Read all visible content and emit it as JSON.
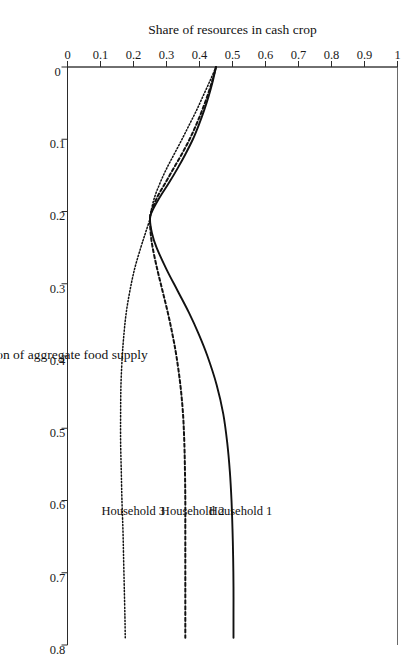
{
  "chart_data": {
    "type": "line",
    "title": "",
    "xlabel": "Coefficient of variation of aggregate food supply",
    "ylabel": "Share of resources in cash crop",
    "xlim": [
      0,
      0.8
    ],
    "ylim": [
      0,
      1
    ],
    "xticks": [
      "0",
      "0.1",
      "0.2",
      "0.3",
      "0.4",
      "0.5",
      "0.6",
      "0.7",
      "0.8"
    ],
    "xtick_values": [
      0,
      0.1,
      0.2,
      0.3,
      0.4,
      0.5,
      0.6,
      0.7,
      0.8
    ],
    "yticks": [
      "0",
      "0.1",
      "0.2",
      "0.3",
      "0.4",
      "0.5",
      "0.6",
      "0.7",
      "0.8",
      "0.9",
      "1"
    ],
    "ytick_values": [
      0,
      0.1,
      0.2,
      0.3,
      0.4,
      0.5,
      0.6,
      0.7,
      0.8,
      0.9,
      1
    ],
    "grid": false,
    "legend": "inline-labels",
    "orientation": "rotated-90-clockwise",
    "series": [
      {
        "name": "Household 1",
        "style": "solid",
        "color": "#111111",
        "label_x": 0.62,
        "label_y": 0.5,
        "x": [
          0.0,
          0.02,
          0.04,
          0.06,
          0.08,
          0.1,
          0.12,
          0.14,
          0.16,
          0.18,
          0.2,
          0.21,
          0.23,
          0.25,
          0.28,
          0.31,
          0.34,
          0.37,
          0.4,
          0.44,
          0.48,
          0.52,
          0.56,
          0.6,
          0.64,
          0.68,
          0.72,
          0.76,
          0.79
        ],
        "y": [
          0.45,
          0.44,
          0.428,
          0.414,
          0.398,
          0.38,
          0.358,
          0.334,
          0.308,
          0.28,
          0.256,
          0.25,
          0.256,
          0.27,
          0.3,
          0.334,
          0.368,
          0.398,
          0.424,
          0.452,
          0.472,
          0.484,
          0.492,
          0.497,
          0.5,
          0.502,
          0.503,
          0.503,
          0.503
        ]
      },
      {
        "name": "Household 2",
        "style": "dashed",
        "color": "#111111",
        "label_x": 0.62,
        "label_y": 0.355,
        "x": [
          0.0,
          0.02,
          0.04,
          0.06,
          0.08,
          0.1,
          0.12,
          0.14,
          0.16,
          0.18,
          0.2,
          0.21,
          0.23,
          0.25,
          0.28,
          0.31,
          0.34,
          0.37,
          0.4,
          0.44,
          0.48,
          0.52,
          0.56,
          0.6,
          0.64,
          0.68,
          0.72,
          0.76,
          0.79
        ],
        "y": [
          0.45,
          0.438,
          0.424,
          0.408,
          0.39,
          0.37,
          0.347,
          0.322,
          0.297,
          0.272,
          0.254,
          0.25,
          0.252,
          0.258,
          0.272,
          0.288,
          0.304,
          0.318,
          0.33,
          0.342,
          0.35,
          0.354,
          0.356,
          0.357,
          0.357,
          0.357,
          0.357,
          0.357,
          0.357
        ]
      },
      {
        "name": "Household 3",
        "style": "dotted",
        "color": "#111111",
        "label_x": 0.62,
        "label_y": 0.175,
        "x": [
          0.0,
          0.02,
          0.04,
          0.06,
          0.08,
          0.1,
          0.12,
          0.14,
          0.16,
          0.18,
          0.2,
          0.21,
          0.23,
          0.25,
          0.28,
          0.31,
          0.34,
          0.37,
          0.4,
          0.44,
          0.48,
          0.52,
          0.56,
          0.6,
          0.64,
          0.68,
          0.72,
          0.76,
          0.79
        ],
        "y": [
          0.45,
          0.431,
          0.411,
          0.391,
          0.369,
          0.347,
          0.324,
          0.301,
          0.281,
          0.264,
          0.253,
          0.25,
          0.236,
          0.222,
          0.203,
          0.189,
          0.178,
          0.171,
          0.166,
          0.162,
          0.161,
          0.161,
          0.163,
          0.165,
          0.168,
          0.17,
          0.172,
          0.174,
          0.175
        ]
      }
    ]
  }
}
